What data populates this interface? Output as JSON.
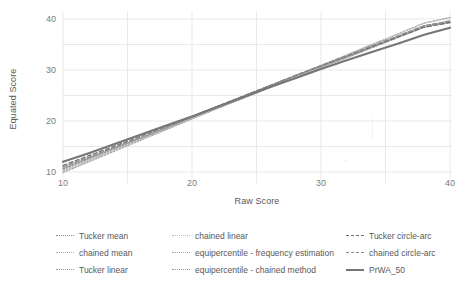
{
  "chart_data": {
    "type": "line",
    "title": "",
    "xlabel": "Raw Score",
    "ylabel": "Equated Score",
    "xlim": [
      10,
      40
    ],
    "ylim": [
      8,
      41
    ],
    "xticks": [
      10,
      20,
      30,
      40
    ],
    "yticks": [
      10,
      20,
      30,
      40
    ],
    "grid": true,
    "legend_position": "bottom",
    "x": [
      10,
      12,
      14,
      16,
      18,
      20,
      22,
      24,
      26,
      28,
      30,
      32,
      34,
      36,
      38,
      40
    ],
    "series": [
      {
        "name": "Tucker mean",
        "style": "dotted",
        "color": "#8c8c8c",
        "values": [
          10.6,
          12.6,
          14.6,
          16.6,
          18.6,
          20.6,
          22.6,
          24.5,
          26.5,
          28.5,
          30.5,
          32.4,
          34.4,
          36.4,
          38.4,
          39.4
        ]
      },
      {
        "name": "chained mean",
        "style": "dotted",
        "color": "#b0b0b0",
        "values": [
          10.4,
          12.4,
          14.4,
          16.5,
          18.5,
          20.5,
          22.5,
          24.5,
          26.5,
          28.5,
          30.5,
          32.5,
          34.5,
          36.5,
          38.5,
          39.7
        ]
      },
      {
        "name": "Tucker linear",
        "style": "dotted",
        "color": "#9e9e9e",
        "values": [
          9.9,
          12.0,
          14.1,
          16.2,
          18.3,
          20.4,
          22.5,
          24.6,
          26.7,
          28.8,
          30.8,
          32.9,
          35.0,
          37.1,
          39.2,
          40.3
        ]
      },
      {
        "name": "chained linear",
        "style": "dotted",
        "color": "#bdbdbd",
        "values": [
          10.2,
          12.2,
          14.3,
          16.4,
          18.5,
          20.5,
          22.6,
          24.7,
          26.8,
          28.8,
          30.9,
          33.0,
          35.1,
          37.1,
          39.2,
          40.2
        ]
      },
      {
        "name": "equipercentile - frequency estimation",
        "style": "dotted",
        "color": "#a6a6a6",
        "values": [
          11.0,
          12.9,
          14.8,
          16.7,
          18.7,
          20.8,
          22.9,
          24.9,
          26.9,
          28.9,
          30.7,
          32.6,
          34.5,
          36.5,
          38.4,
          39.3
        ]
      },
      {
        "name": "equipercentile - chained method",
        "style": "dotted",
        "color": "#9a9a9a",
        "values": [
          10.7,
          12.7,
          14.7,
          16.6,
          18.6,
          20.7,
          22.8,
          24.9,
          26.9,
          28.9,
          30.8,
          32.7,
          34.7,
          36.7,
          38.7,
          39.5
        ]
      },
      {
        "name": "Tucker circle-arc",
        "style": "dashed",
        "color": "#6e6e6e",
        "values": [
          11.3,
          13.2,
          15.1,
          17.0,
          18.9,
          20.9,
          22.9,
          24.9,
          26.9,
          28.9,
          30.8,
          32.7,
          34.6,
          36.5,
          38.4,
          39.3
        ]
      },
      {
        "name": "chained circle-arc",
        "style": "dashed",
        "color": "#8a8a8a",
        "values": [
          11.0,
          12.9,
          14.9,
          16.9,
          18.9,
          20.9,
          22.9,
          24.9,
          26.9,
          28.9,
          30.9,
          32.8,
          34.8,
          36.7,
          38.7,
          39.6
        ]
      },
      {
        "name": "PrWA_50",
        "style": "solid",
        "color": "#767676",
        "values": [
          12.0,
          13.7,
          15.5,
          17.3,
          19.1,
          20.9,
          22.8,
          24.7,
          26.6,
          28.4,
          30.2,
          31.9,
          33.6,
          35.2,
          36.9,
          38.3
        ]
      }
    ]
  },
  "axes": {
    "y_title": "Equated Score",
    "x_title": "Raw Score",
    "y_tick_labels": [
      "40",
      "30",
      "20",
      "10"
    ],
    "x_tick_labels": [
      "10",
      "20",
      "30",
      "40"
    ]
  },
  "legend": {
    "columns": [
      {
        "items": [
          {
            "label": "Tucker mean"
          },
          {
            "label": "chained mean"
          },
          {
            "label": "Tucker linear"
          }
        ]
      },
      {
        "items": [
          {
            "label": "chained linear"
          },
          {
            "label": "equipercentile - frequency estimation"
          },
          {
            "label": "equipercentile - chained method"
          }
        ]
      },
      {
        "items": [
          {
            "label": "Tucker circle-arc"
          },
          {
            "label": "chained circle-arc"
          },
          {
            "label": "PrWA_50"
          }
        ]
      }
    ]
  },
  "style": {
    "grid_color": "#e9e9e9",
    "text_color": "#595959",
    "tick_color": "#7a7a7a",
    "background": "#ffffff"
  }
}
